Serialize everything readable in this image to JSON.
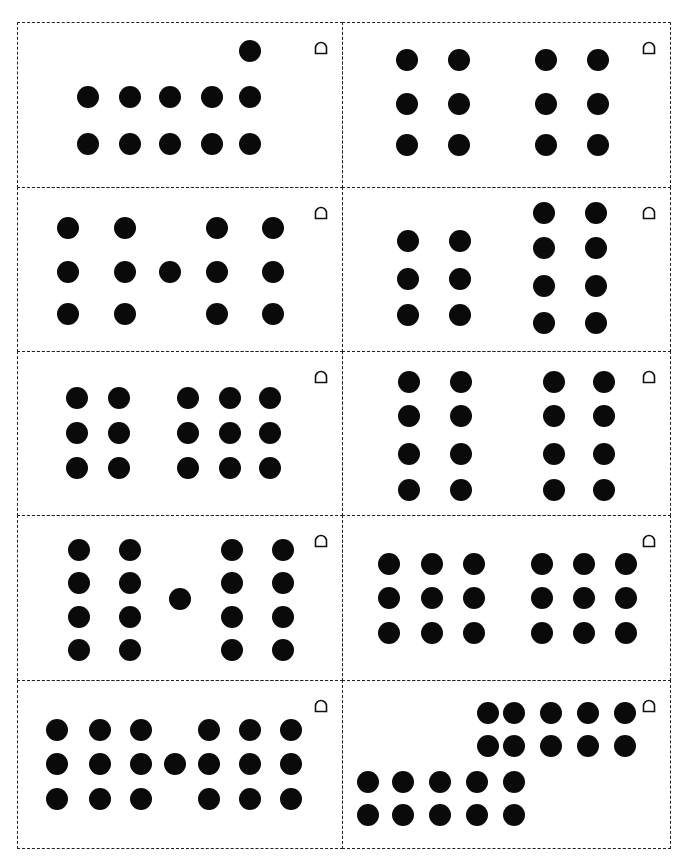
{
  "sheet": {
    "card_letter": "D",
    "dot_color": "#0a0a0a",
    "border_color": "#222222",
    "columns_x": [
      17,
      342,
      670
    ],
    "rows_y": [
      22,
      187,
      351,
      515,
      680,
      848
    ]
  },
  "cards": [
    {
      "id": 1,
      "count": 11,
      "letter": "D",
      "col": 0,
      "row": 0,
      "dots": [
        [
          250,
          51
        ],
        [
          88,
          97
        ],
        [
          130,
          97
        ],
        [
          170,
          97
        ],
        [
          212,
          97
        ],
        [
          250,
          97
        ],
        [
          88,
          144
        ],
        [
          130,
          144
        ],
        [
          170,
          144
        ],
        [
          212,
          144
        ],
        [
          250,
          144
        ]
      ]
    },
    {
      "id": 2,
      "count": 12,
      "letter": "D",
      "col": 1,
      "row": 0,
      "dots": [
        [
          407,
          60
        ],
        [
          459,
          60
        ],
        [
          546,
          60
        ],
        [
          598,
          60
        ],
        [
          407,
          104
        ],
        [
          459,
          104
        ],
        [
          546,
          104
        ],
        [
          598,
          104
        ],
        [
          407,
          145
        ],
        [
          459,
          145
        ],
        [
          546,
          145
        ],
        [
          598,
          145
        ]
      ]
    },
    {
      "id": 3,
      "count": 13,
      "letter": "D",
      "col": 0,
      "row": 1,
      "dots": [
        [
          68,
          228
        ],
        [
          125,
          228
        ],
        [
          217,
          228
        ],
        [
          273,
          228
        ],
        [
          68,
          272
        ],
        [
          125,
          272
        ],
        [
          170,
          272
        ],
        [
          217,
          272
        ],
        [
          273,
          272
        ],
        [
          68,
          314
        ],
        [
          125,
          314
        ],
        [
          217,
          314
        ],
        [
          273,
          314
        ]
      ]
    },
    {
      "id": 4,
      "count": 14,
      "letter": "D",
      "col": 1,
      "row": 1,
      "dots": [
        [
          408,
          241
        ],
        [
          460,
          241
        ],
        [
          408,
          279
        ],
        [
          460,
          279
        ],
        [
          408,
          315
        ],
        [
          460,
          315
        ],
        [
          544,
          213
        ],
        [
          596,
          213
        ],
        [
          544,
          248
        ],
        [
          596,
          248
        ],
        [
          544,
          286
        ],
        [
          596,
          286
        ],
        [
          544,
          323
        ],
        [
          596,
          323
        ]
      ]
    },
    {
      "id": 5,
      "count": 15,
      "letter": "D",
      "col": 0,
      "row": 2,
      "dots": [
        [
          77,
          398
        ],
        [
          119,
          398
        ],
        [
          188,
          398
        ],
        [
          230,
          398
        ],
        [
          270,
          398
        ],
        [
          77,
          433
        ],
        [
          119,
          433
        ],
        [
          188,
          433
        ],
        [
          230,
          433
        ],
        [
          270,
          433
        ],
        [
          77,
          468
        ],
        [
          119,
          468
        ],
        [
          188,
          468
        ],
        [
          230,
          468
        ],
        [
          270,
          468
        ]
      ]
    },
    {
      "id": 6,
      "count": 16,
      "letter": "D",
      "col": 1,
      "row": 2,
      "dots": [
        [
          409,
          382
        ],
        [
          461,
          382
        ],
        [
          554,
          382
        ],
        [
          604,
          382
        ],
        [
          409,
          416
        ],
        [
          461,
          416
        ],
        [
          554,
          416
        ],
        [
          604,
          416
        ],
        [
          409,
          454
        ],
        [
          461,
          454
        ],
        [
          554,
          454
        ],
        [
          604,
          454
        ],
        [
          409,
          490
        ],
        [
          461,
          490
        ],
        [
          554,
          490
        ],
        [
          604,
          490
        ]
      ]
    },
    {
      "id": 7,
      "count": 17,
      "letter": "D",
      "col": 0,
      "row": 3,
      "dots": [
        [
          79,
          550
        ],
        [
          130,
          550
        ],
        [
          232,
          550
        ],
        [
          283,
          550
        ],
        [
          79,
          583
        ],
        [
          130,
          583
        ],
        [
          232,
          583
        ],
        [
          283,
          583
        ],
        [
          180,
          599
        ],
        [
          79,
          617
        ],
        [
          130,
          617
        ],
        [
          232,
          617
        ],
        [
          283,
          617
        ],
        [
          79,
          650
        ],
        [
          130,
          650
        ],
        [
          232,
          650
        ],
        [
          283,
          650
        ]
      ]
    },
    {
      "id": 8,
      "count": 18,
      "letter": "D",
      "col": 1,
      "row": 3,
      "dots": [
        [
          389,
          564
        ],
        [
          432,
          564
        ],
        [
          474,
          564
        ],
        [
          542,
          564
        ],
        [
          584,
          564
        ],
        [
          626,
          564
        ],
        [
          389,
          598
        ],
        [
          432,
          598
        ],
        [
          474,
          598
        ],
        [
          542,
          598
        ],
        [
          584,
          598
        ],
        [
          626,
          598
        ],
        [
          389,
          633
        ],
        [
          432,
          633
        ],
        [
          474,
          633
        ],
        [
          542,
          633
        ],
        [
          584,
          633
        ],
        [
          626,
          633
        ]
      ]
    },
    {
      "id": 9,
      "count": 19,
      "letter": "D",
      "col": 0,
      "row": 4,
      "dots": [
        [
          57,
          730
        ],
        [
          100,
          730
        ],
        [
          141,
          730
        ],
        [
          209,
          730
        ],
        [
          250,
          730
        ],
        [
          291,
          730
        ],
        [
          57,
          764
        ],
        [
          100,
          764
        ],
        [
          141,
          764
        ],
        [
          175,
          764
        ],
        [
          209,
          764
        ],
        [
          250,
          764
        ],
        [
          291,
          764
        ],
        [
          57,
          799
        ],
        [
          100,
          799
        ],
        [
          141,
          799
        ],
        [
          209,
          799
        ],
        [
          250,
          799
        ],
        [
          291,
          799
        ]
      ]
    },
    {
      "id": 10,
      "count": 20,
      "letter": "D",
      "col": 1,
      "row": 4,
      "dots": [
        [
          488,
          713
        ],
        [
          514,
          713
        ],
        [
          551,
          713
        ],
        [
          588,
          713
        ],
        [
          625,
          713
        ],
        [
          488,
          746
        ],
        [
          514,
          746
        ],
        [
          551,
          746
        ],
        [
          588,
          746
        ],
        [
          625,
          746
        ],
        [
          368,
          782
        ],
        [
          403,
          782
        ],
        [
          440,
          782
        ],
        [
          477,
          782
        ],
        [
          514,
          782
        ],
        [
          368,
          815
        ],
        [
          403,
          815
        ],
        [
          440,
          815
        ],
        [
          477,
          815
        ],
        [
          514,
          815
        ]
      ]
    }
  ]
}
